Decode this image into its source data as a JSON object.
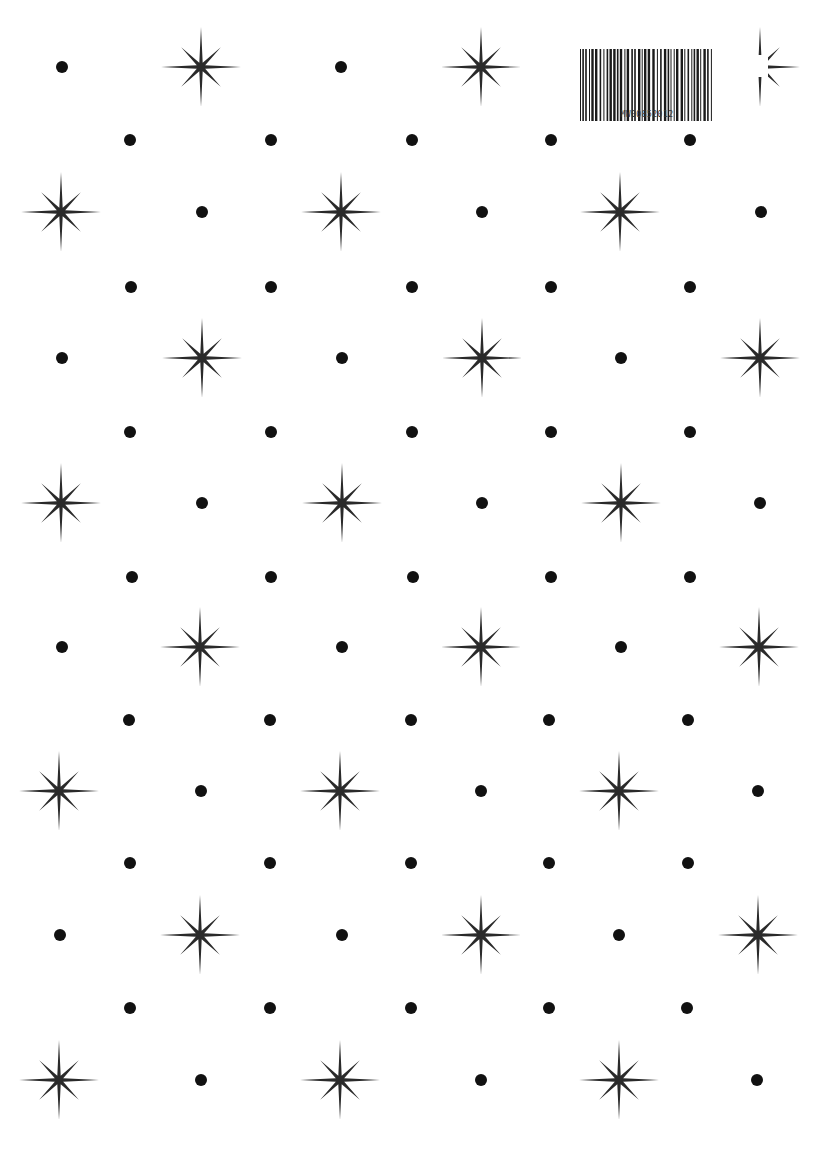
{
  "page": {
    "background": "#ffffff",
    "ink_color": "#2a2a2a",
    "dot_color": "#111111"
  },
  "barcode": {
    "label": "MW00852012",
    "x": 578,
    "y": 49,
    "width": 138,
    "height": 60
  },
  "pattern": {
    "star_outer_cardinal": 40,
    "star_outer_diagonal": 28,
    "dot_radius": 6,
    "rows": [
      {
        "y": 67,
        "items": [
          {
            "t": "dot",
            "x": 62
          },
          {
            "t": "star",
            "x": 201
          },
          {
            "t": "dot",
            "x": 341
          },
          {
            "t": "star",
            "x": 481
          },
          {
            "t": "star-partial",
            "x": 760
          }
        ]
      },
      {
        "y": 140,
        "items": [
          {
            "t": "dot",
            "x": 130
          },
          {
            "t": "dot",
            "x": 271
          },
          {
            "t": "dot",
            "x": 412
          },
          {
            "t": "dot",
            "x": 551
          },
          {
            "t": "dot",
            "x": 690
          }
        ]
      },
      {
        "y": 212,
        "items": [
          {
            "t": "star",
            "x": 61
          },
          {
            "t": "dot",
            "x": 202
          },
          {
            "t": "star",
            "x": 341
          },
          {
            "t": "dot",
            "x": 482
          },
          {
            "t": "star",
            "x": 620
          },
          {
            "t": "dot",
            "x": 761
          }
        ]
      },
      {
        "y": 287,
        "items": [
          {
            "t": "dot",
            "x": 131
          },
          {
            "t": "dot",
            "x": 271
          },
          {
            "t": "dot",
            "x": 412
          },
          {
            "t": "dot",
            "x": 551
          },
          {
            "t": "dot",
            "x": 690
          }
        ]
      },
      {
        "y": 358,
        "items": [
          {
            "t": "dot",
            "x": 62
          },
          {
            "t": "star",
            "x": 202
          },
          {
            "t": "dot",
            "x": 342
          },
          {
            "t": "star",
            "x": 482
          },
          {
            "t": "dot",
            "x": 621
          },
          {
            "t": "star",
            "x": 760
          }
        ]
      },
      {
        "y": 432,
        "items": [
          {
            "t": "dot",
            "x": 130
          },
          {
            "t": "dot",
            "x": 271
          },
          {
            "t": "dot",
            "x": 412
          },
          {
            "t": "dot",
            "x": 551
          },
          {
            "t": "dot",
            "x": 690
          }
        ]
      },
      {
        "y": 503,
        "items": [
          {
            "t": "star",
            "x": 61
          },
          {
            "t": "dot",
            "x": 202
          },
          {
            "t": "star",
            "x": 342
          },
          {
            "t": "dot",
            "x": 482
          },
          {
            "t": "star",
            "x": 621
          },
          {
            "t": "dot",
            "x": 760
          }
        ]
      },
      {
        "y": 577,
        "items": [
          {
            "t": "dot",
            "x": 132
          },
          {
            "t": "dot",
            "x": 271
          },
          {
            "t": "dot",
            "x": 413
          },
          {
            "t": "dot",
            "x": 551
          },
          {
            "t": "dot",
            "x": 690
          }
        ]
      },
      {
        "y": 647,
        "items": [
          {
            "t": "dot",
            "x": 62
          },
          {
            "t": "star",
            "x": 200
          },
          {
            "t": "dot",
            "x": 342
          },
          {
            "t": "star",
            "x": 481
          },
          {
            "t": "dot",
            "x": 621
          },
          {
            "t": "star",
            "x": 759
          }
        ]
      },
      {
        "y": 720,
        "items": [
          {
            "t": "dot",
            "x": 129
          },
          {
            "t": "dot",
            "x": 270
          },
          {
            "t": "dot",
            "x": 411
          },
          {
            "t": "dot",
            "x": 549
          },
          {
            "t": "dot",
            "x": 688
          }
        ]
      },
      {
        "y": 791,
        "items": [
          {
            "t": "star",
            "x": 59
          },
          {
            "t": "dot",
            "x": 201
          },
          {
            "t": "star",
            "x": 340
          },
          {
            "t": "dot",
            "x": 481
          },
          {
            "t": "star",
            "x": 619
          },
          {
            "t": "dot",
            "x": 758
          }
        ]
      },
      {
        "y": 863,
        "items": [
          {
            "t": "dot",
            "x": 130
          },
          {
            "t": "dot",
            "x": 270
          },
          {
            "t": "dot",
            "x": 411
          },
          {
            "t": "dot",
            "x": 549
          },
          {
            "t": "dot",
            "x": 688
          }
        ]
      },
      {
        "y": 935,
        "items": [
          {
            "t": "dot",
            "x": 60
          },
          {
            "t": "star",
            "x": 200
          },
          {
            "t": "dot",
            "x": 342
          },
          {
            "t": "star",
            "x": 481
          },
          {
            "t": "dot",
            "x": 619
          },
          {
            "t": "star",
            "x": 758
          }
        ]
      },
      {
        "y": 1008,
        "items": [
          {
            "t": "dot",
            "x": 130
          },
          {
            "t": "dot",
            "x": 270
          },
          {
            "t": "dot",
            "x": 411
          },
          {
            "t": "dot",
            "x": 549
          },
          {
            "t": "dot",
            "x": 687
          }
        ]
      },
      {
        "y": 1080,
        "items": [
          {
            "t": "star",
            "x": 59
          },
          {
            "t": "dot",
            "x": 201
          },
          {
            "t": "star",
            "x": 340
          },
          {
            "t": "dot",
            "x": 481
          },
          {
            "t": "star",
            "x": 619
          },
          {
            "t": "dot",
            "x": 757
          }
        ]
      }
    ]
  }
}
